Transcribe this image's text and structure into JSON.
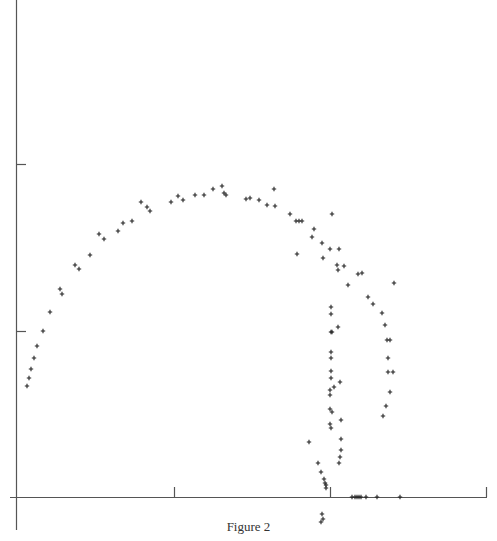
{
  "figure": {
    "caption": "Figure 2"
  },
  "chart_data": {
    "type": "scatter",
    "title": "",
    "xlabel": "",
    "ylabel": "",
    "marker": "+",
    "grid": false,
    "legend": null,
    "axes": {
      "x_ticks_px": [
        174,
        330,
        486
      ],
      "y_ticks_px": [
        164,
        331
      ],
      "x_axis_y_px": 497,
      "y_axis_x_px": 16
    },
    "series": [
      {
        "name": "arc",
        "points_px": [
          [
            27,
            386
          ],
          [
            29,
            378
          ],
          [
            31,
            369
          ],
          [
            34,
            358
          ],
          [
            37,
            346
          ],
          [
            43,
            331
          ],
          [
            50,
            312
          ],
          [
            60,
            289
          ],
          [
            62,
            294
          ],
          [
            75,
            265
          ],
          [
            79,
            269
          ],
          [
            90,
            255
          ],
          [
            99,
            234
          ],
          [
            104,
            239
          ],
          [
            118,
            231
          ],
          [
            123,
            223
          ],
          [
            132,
            221
          ],
          [
            141,
            202
          ],
          [
            147,
            207
          ],
          [
            150,
            211
          ],
          [
            171,
            202
          ],
          [
            178,
            196
          ],
          [
            183,
            200
          ],
          [
            195,
            195
          ],
          [
            204,
            195
          ],
          [
            213,
            189
          ],
          [
            222,
            186
          ],
          [
            224,
            193
          ],
          [
            226,
            195
          ],
          [
            246,
            199
          ],
          [
            250,
            198
          ],
          [
            259,
            200
          ],
          [
            267,
            205
          ],
          [
            274,
            189
          ],
          [
            275,
            206
          ],
          [
            290,
            214
          ],
          [
            296,
            221
          ],
          [
            299,
            221
          ],
          [
            302,
            221
          ],
          [
            297,
            254
          ]
        ]
      },
      {
        "name": "right-branch",
        "points_px": [
          [
            332,
            214
          ],
          [
            314,
            229
          ],
          [
            312,
            237
          ],
          [
            322,
            243
          ],
          [
            330,
            249
          ],
          [
            339,
            249
          ],
          [
            323,
            258
          ],
          [
            337,
            265
          ],
          [
            338,
            270
          ],
          [
            344,
            266
          ],
          [
            348,
            285
          ],
          [
            358,
            274
          ],
          [
            362,
            273
          ],
          [
            368,
            297
          ],
          [
            373,
            304
          ],
          [
            382,
            313
          ],
          [
            385,
            325
          ],
          [
            394,
            283
          ],
          [
            387,
            340
          ],
          [
            390,
            340
          ],
          [
            388,
            358
          ],
          [
            388,
            372
          ],
          [
            393,
            372
          ],
          [
            390,
            392
          ],
          [
            386,
            406
          ],
          [
            383,
            416
          ]
        ]
      },
      {
        "name": "vertical-branch",
        "points_px": [
          [
            331,
            307
          ],
          [
            331,
            314
          ],
          [
            331,
            332
          ],
          [
            332,
            332
          ],
          [
            338,
            327
          ],
          [
            331,
            352
          ],
          [
            331,
            358
          ],
          [
            331,
            371
          ],
          [
            331,
            378
          ],
          [
            340,
            382
          ],
          [
            334,
            387
          ],
          [
            330,
            390
          ],
          [
            330,
            395
          ],
          [
            330,
            409
          ],
          [
            332,
            412
          ],
          [
            341,
            420
          ],
          [
            330,
            424
          ],
          [
            331,
            428
          ],
          [
            341,
            439
          ],
          [
            341,
            450
          ],
          [
            340,
            457
          ],
          [
            339,
            463
          ],
          [
            309,
            442
          ],
          [
            318,
            463
          ],
          [
            321,
            472
          ],
          [
            324,
            479
          ],
          [
            325,
            483
          ],
          [
            326,
            485
          ],
          [
            326,
            488
          ]
        ]
      },
      {
        "name": "axis-cluster",
        "points_px": [
          [
            352,
            497
          ],
          [
            355,
            497
          ],
          [
            357,
            497
          ],
          [
            359,
            497
          ],
          [
            361,
            497
          ],
          [
            366,
            497
          ],
          [
            377,
            497
          ],
          [
            400,
            497
          ],
          [
            322,
            514
          ],
          [
            323,
            519
          ],
          [
            321,
            522
          ]
        ]
      }
    ]
  }
}
